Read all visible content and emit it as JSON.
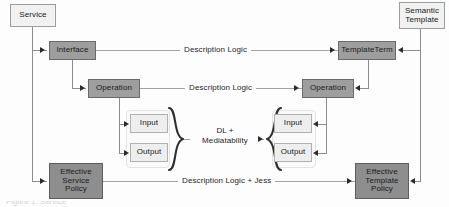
{
  "diagram": {
    "colors": {
      "light_box": "#f1f1f1",
      "mid_box": "#9e9e9e",
      "dark_box": "#8e8e8e",
      "line": "#8c8c8c",
      "arrow": "#2b2b2b",
      "text": "#1a1a1a",
      "background": "#fdfdfd"
    },
    "left_root": {
      "label": "Service"
    },
    "right_root": {
      "label": "Semantic\nTemplate"
    },
    "rows": [
      {
        "id": "interface-row",
        "left_node": "Interface",
        "right_node": "TemplateTerm",
        "edge_label": "Description Logic"
      },
      {
        "id": "operation-row",
        "left_node": "Operation",
        "right_node": "Operation",
        "edge_label": "Description Logic"
      },
      {
        "id": "io-row",
        "left_nodes": [
          "Input",
          "Output"
        ],
        "right_nodes": [
          "Input",
          "Output"
        ],
        "edge_label": "DL +\nMediatability"
      },
      {
        "id": "policy-row",
        "left_node": "Effective\nService\nPolicy",
        "right_node": "Effective\nTemplate\nPolicy",
        "edge_label": "Description Logic + Jess"
      }
    ],
    "caption_fragment": "Figure 1. Service"
  }
}
